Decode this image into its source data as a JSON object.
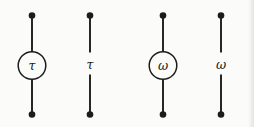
{
  "figure": {
    "background_color": "#fbfbf9",
    "ink_color": "#1c1c1c",
    "items": [
      {
        "id": "edge-tau-circled",
        "label": "τ",
        "label_style": "circled",
        "x": 32
      },
      {
        "id": "edge-tau-plain",
        "label": "τ",
        "label_style": "plain",
        "x": 90
      },
      {
        "id": "edge-omega-circled",
        "label": "ω",
        "label_style": "circled",
        "x": 163
      },
      {
        "id": "edge-omega-plain",
        "label": "ω",
        "label_style": "plain",
        "x": 221
      }
    ]
  }
}
